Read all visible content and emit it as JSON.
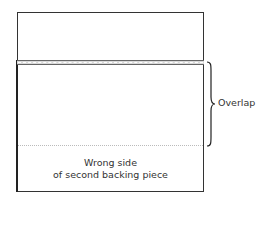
{
  "diagram": {
    "labels": {
      "overlap": "Overlap",
      "wrong_side_line1": "Wrong side",
      "wrong_side_line2": "of second backing piece"
    },
    "colors": {
      "outline": "#333333",
      "seam_fill": "#d9d9d9",
      "text": "#333333"
    }
  }
}
